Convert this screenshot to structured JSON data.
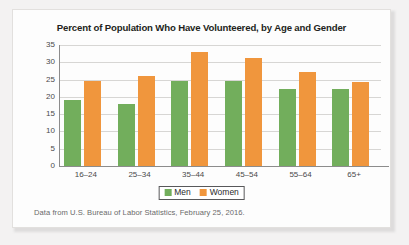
{
  "chart_data": {
    "type": "bar",
    "title": "Percent of Population Who Have Volunteered, by Age and Gender",
    "xlabel": "",
    "ylabel": "",
    "ylim": [
      0,
      35
    ],
    "yticks": [
      "35",
      "30",
      "25",
      "20",
      "15",
      "10",
      "5",
      "0"
    ],
    "ytick_values": [
      35,
      30,
      25,
      20,
      15,
      10,
      5,
      0
    ],
    "grid": true,
    "legend_position": "bottom",
    "categories": [
      "16–24",
      "25–34",
      "35–44",
      "45–54",
      "55–64",
      "65+"
    ],
    "series": [
      {
        "name": "Men",
        "color": "#72ae5c",
        "values": [
          19.0,
          18.0,
          24.5,
          24.5,
          22.3,
          22.3
        ]
      },
      {
        "name": "Women",
        "color": "#f0963d",
        "values": [
          24.7,
          26.1,
          33.0,
          31.2,
          27.3,
          24.4
        ]
      }
    ],
    "annotations": [
      "Data from U.S. Bureau of Labor Statistics, February 25, 2016."
    ]
  },
  "legend": {
    "items": [
      {
        "label": "Men",
        "color": "#72ae5c"
      },
      {
        "label": "Women",
        "color": "#f0963d"
      }
    ]
  },
  "source_note": "Data from U.S. Bureau of Labor Statistics, February 25, 2016.",
  "colors": {
    "men": "#72ae5c",
    "women": "#f0963d",
    "axis": "#8c8c8c",
    "gridline": "#d7d6d4",
    "title_text": "#231f20",
    "tick_text": "#4a4a4a",
    "note_text": "#6a6a6a",
    "card_background": "#fdfdfd",
    "page_background": "#f3f2f2"
  }
}
